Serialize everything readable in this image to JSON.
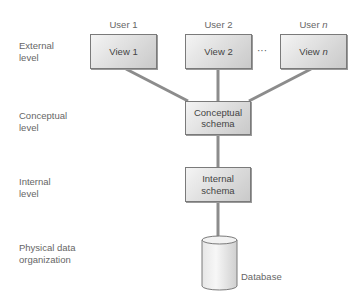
{
  "diagram": {
    "levels": [
      {
        "line1": "External",
        "line2": "level"
      },
      {
        "line1": "Conceptual",
        "line2": "level"
      },
      {
        "line1": "Internal",
        "line2": "level"
      },
      {
        "line1": "Physical data",
        "line2": "organization"
      }
    ],
    "users": [
      {
        "label": "User 1"
      },
      {
        "label": "User 2"
      },
      {
        "label_prefix": "User ",
        "label_italic": "n"
      }
    ],
    "views": [
      {
        "label": "View 1"
      },
      {
        "label": "View 2"
      },
      {
        "label_prefix": "View ",
        "label_italic": "n"
      }
    ],
    "ellipsis": "···",
    "conceptual_schema": {
      "line1": "Conceptual",
      "line2": "schema"
    },
    "internal_schema": {
      "line1": "Internal",
      "line2": "schema"
    },
    "database": {
      "label": "Database"
    },
    "colors": {
      "connector": "#8c8c8c",
      "box_border": "#7a7a7a",
      "box_fill_light": "#f4f4f4",
      "box_fill_dark": "#c9c9c9",
      "text": "#555555"
    }
  }
}
